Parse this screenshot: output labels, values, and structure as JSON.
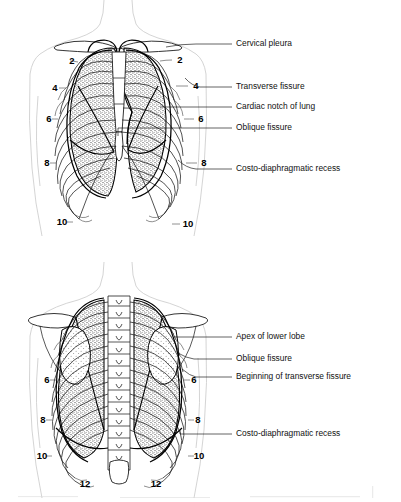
{
  "figure": {
    "panels": [
      {
        "id": "anterior",
        "view_name": "Anterior view of thorax",
        "labels": [
          {
            "text": "Cervical pleura",
            "x": 236,
            "y": 44,
            "leader_to_x": 166,
            "leader_to_y": 47
          },
          {
            "text": "Transverse fissure",
            "x": 236,
            "y": 87,
            "leader_to_x": 185,
            "leader_to_y": 78
          },
          {
            "text": "Cardiac notch of lung",
            "x": 236,
            "y": 107,
            "leader_to_x": 160,
            "leader_to_y": 107
          },
          {
            "text": "Oblique fissure",
            "x": 236,
            "y": 128,
            "leader_to_x": 118,
            "leader_to_y": 136
          },
          {
            "text": "Costo-diaphragmatic recess",
            "x": 236,
            "y": 169,
            "leader_to_x": 178,
            "leader_to_y": 160
          }
        ],
        "rib_numbers_left": [
          {
            "n": "2",
            "x": 72,
            "y": 61
          },
          {
            "n": "4",
            "x": 55,
            "y": 88
          },
          {
            "n": "6",
            "x": 49,
            "y": 119
          },
          {
            "n": "8",
            "x": 47,
            "y": 163
          },
          {
            "n": "10",
            "x": 62,
            "y": 222
          }
        ],
        "rib_numbers_right": [
          {
            "n": "2",
            "x": 180,
            "y": 60
          },
          {
            "n": "4",
            "x": 196,
            "y": 86
          },
          {
            "n": "6",
            "x": 201,
            "y": 119
          },
          {
            "n": "8",
            "x": 204,
            "y": 163
          },
          {
            "n": "10",
            "x": 188,
            "y": 224
          }
        ]
      },
      {
        "id": "posterior",
        "view_name": "Posterior view of thorax",
        "labels": [
          {
            "text": "Apex of lower lobe",
            "x": 236,
            "y": 337,
            "leader_to_x": 174,
            "leader_to_y": 337
          },
          {
            "text": "Oblique fissure",
            "x": 236,
            "y": 359,
            "leader_to_x": 178,
            "leader_to_y": 353
          },
          {
            "text": "Beginning of transverse fissure",
            "x": 236,
            "y": 377,
            "leader_to_x": 182,
            "leader_to_y": 369
          },
          {
            "text": "Costo-diaphragmatic recess",
            "x": 236,
            "y": 434,
            "leader_to_x": 180,
            "leader_to_y": 430
          }
        ],
        "rib_numbers_left": [
          {
            "n": "6",
            "x": 47,
            "y": 380
          },
          {
            "n": "8",
            "x": 43,
            "y": 420
          },
          {
            "n": "10",
            "x": 42,
            "y": 456
          },
          {
            "n": "12",
            "x": 85,
            "y": 484
          }
        ],
        "rib_numbers_right": [
          {
            "n": "6",
            "x": 194,
            "y": 380
          },
          {
            "n": "8",
            "x": 198,
            "y": 420
          },
          {
            "n": "10",
            "x": 199,
            "y": 456
          },
          {
            "n": "12",
            "x": 156,
            "y": 484
          }
        ]
      }
    ],
    "colors": {
      "ink": "#111111",
      "silhouette": "#c9c9c9",
      "lung_stipple": "#555555",
      "background": "#ffffff"
    }
  }
}
